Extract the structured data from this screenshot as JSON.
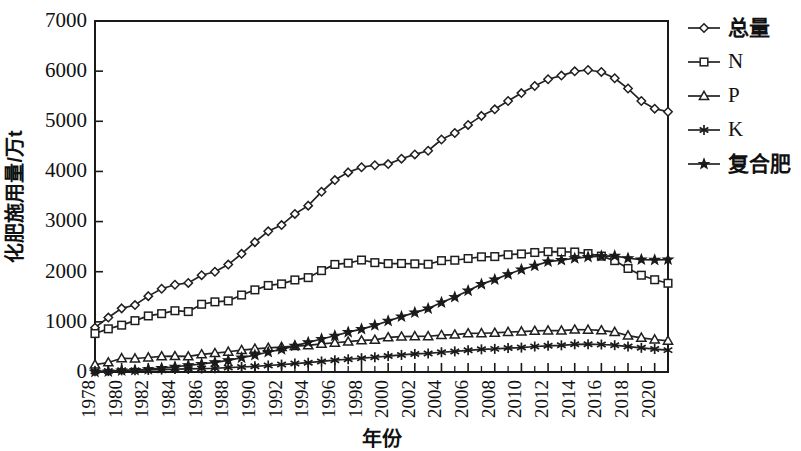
{
  "chart_data": {
    "type": "line",
    "title": "",
    "xlabel": "年份",
    "ylabel": "化肥施用量/万t",
    "xlim": [
      1978,
      2021
    ],
    "ylim": [
      0,
      7000
    ],
    "ytick_step": 1000,
    "xtick_step": 2,
    "grid": false,
    "legend_position": "right",
    "yticks": [
      "0",
      "1000",
      "2000",
      "3000",
      "4000",
      "5000",
      "6000",
      "7000"
    ],
    "xticks": [
      "1978",
      "1980",
      "1982",
      "1984",
      "1986",
      "1988",
      "1990",
      "1992",
      "1994",
      "1996",
      "1998",
      "2000",
      "2002",
      "2004",
      "2006",
      "2008",
      "2010",
      "2012",
      "2014",
      "2016",
      "2018",
      "2020"
    ],
    "x": [
      1978,
      1979,
      1980,
      1981,
      1982,
      1983,
      1984,
      1985,
      1986,
      1987,
      1988,
      1989,
      1990,
      1991,
      1992,
      1993,
      1994,
      1995,
      1996,
      1997,
      1998,
      1999,
      2000,
      2001,
      2002,
      2003,
      2004,
      2005,
      2006,
      2007,
      2008,
      2009,
      2010,
      2011,
      2012,
      2013,
      2014,
      2015,
      2016,
      2017,
      2018,
      2019,
      2020,
      2021
    ],
    "series": [
      {
        "name": "总量",
        "marker": "diamond-open",
        "values": [
          884,
          1086,
          1269,
          1335,
          1513,
          1660,
          1740,
          1776,
          1931,
          1999,
          2142,
          2357,
          2590,
          2806,
          2930,
          3152,
          3318,
          3594,
          3828,
          3981,
          4084,
          4124,
          4146,
          4254,
          4339,
          4412,
          4637,
          4766,
          4928,
          5108,
          5239,
          5404,
          5562,
          5704,
          5839,
          5912,
          5996,
          6023,
          5984,
          5859,
          5653,
          5404,
          5251,
          5191
        ]
      },
      {
        "name": "N",
        "marker": "square-open",
        "values": [
          767,
          861,
          934,
          1024,
          1118,
          1164,
          1222,
          1205,
          1351,
          1399,
          1418,
          1535,
          1638,
          1726,
          1757,
          1836,
          1882,
          2022,
          2145,
          2171,
          2233,
          2181,
          2162,
          2164,
          2157,
          2149,
          2221,
          2229,
          2263,
          2297,
          2302,
          2339,
          2354,
          2383,
          2399,
          2394,
          2393,
          2362,
          2311,
          2221,
          2065,
          1930,
          1840,
          1770
        ]
      },
      {
        "name": "P",
        "marker": "triangle-open",
        "values": [
          147,
          190,
          274,
          269,
          289,
          311,
          315,
          310,
          352,
          375,
          404,
          436,
          462,
          480,
          498,
          518,
          532,
          562,
          583,
          604,
          629,
          640,
          690,
          706,
          712,
          713,
          736,
          744,
          769,
          773,
          780,
          798,
          806,
          819,
          828,
          825,
          845,
          843,
          830,
          797,
          727,
          682,
          648,
          622
        ]
      },
      {
        "name": "K",
        "marker": "star6",
        "values": [
          16,
          18,
          34,
          36,
          41,
          48,
          58,
          61,
          68,
          75,
          88,
          100,
          114,
          130,
          148,
          168,
          186,
          210,
          236,
          254,
          276,
          294,
          317,
          340,
          360,
          371,
          394,
          411,
          433,
          452,
          461,
          478,
          487,
          509,
          523,
          532,
          552,
          555,
          548,
          535,
          508,
          482,
          458,
          436
        ]
      },
      {
        "name": "复合肥",
        "marker": "star5-solid",
        "values": [
          2,
          9,
          27,
          38,
          54,
          76,
          105,
          132,
          160,
          192,
          232,
          286,
          337,
          398,
          452,
          521,
          590,
          658,
          722,
          794,
          856,
          930,
          1018,
          1104,
          1184,
          1264,
          1386,
          1494,
          1622,
          1752,
          1842,
          1948,
          2043,
          2119,
          2201,
          2231,
          2268,
          2294,
          2312,
          2316,
          2268,
          2243,
          2235,
          2243
        ]
      }
    ],
    "legend": [
      {
        "label": "总量",
        "marker": "diamond-open"
      },
      {
        "label": "N",
        "marker": "square-open"
      },
      {
        "label": "P",
        "marker": "triangle-open"
      },
      {
        "label": "K",
        "marker": "star6"
      },
      {
        "label": "复合肥",
        "marker": "star5-solid"
      }
    ]
  }
}
